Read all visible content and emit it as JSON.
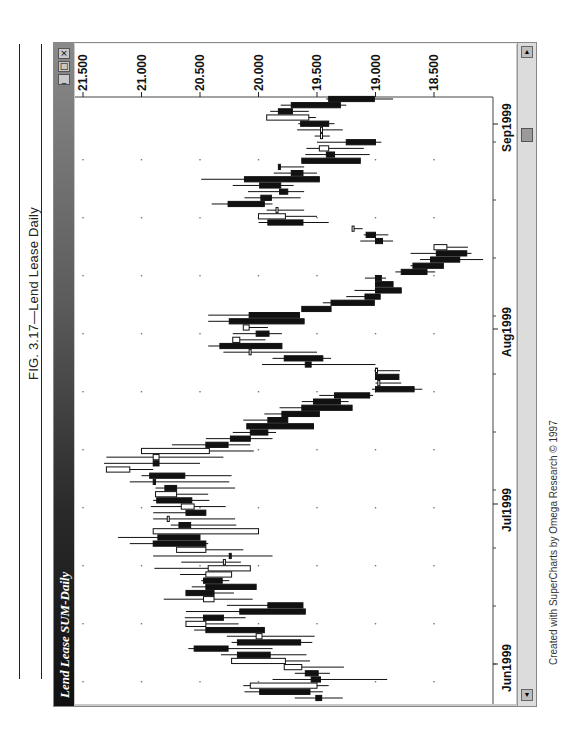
{
  "figure": {
    "caption": "FIG. 3.17—Lend Lease Daily",
    "credit": "Created with SuperCharts by Omega Research © 1997"
  },
  "window": {
    "title": "Lend Lease  SUM-Daily",
    "buttons": {
      "close": "×",
      "maximize": "□",
      "minimize": "_"
    },
    "scrollbar": {
      "up": "▲",
      "down": "▼"
    }
  },
  "chart_data": {
    "type": "candlestick",
    "title": "Lend Lease SUM-Daily",
    "orientation": "rotated 90° (time runs bottom→top, price increases leftward)",
    "price_axis": {
      "ticks": [
        21.5,
        21.0,
        20.5,
        20.0,
        19.5,
        19.0,
        18.5
      ],
      "tick_labels": [
        "21.500",
        "21.000",
        "20.500",
        "20.000",
        "19.500",
        "19.000",
        "18.500"
      ],
      "range": [
        18.0,
        21.6
      ]
    },
    "time_axis": {
      "month_labels": [
        "Jun1999",
        "Jul1999",
        "Aug1999",
        "Sep1999"
      ]
    },
    "grid": "dotted",
    "bars": [
      {
        "o": 19.51,
        "h": 19.69,
        "l": 19.28,
        "c": 19.46
      },
      {
        "o": 19.99,
        "h": 20.12,
        "l": 19.45,
        "c": 19.56
      },
      {
        "o": 19.5,
        "h": 20.13,
        "l": 19.4,
        "c": 20.07
      },
      {
        "o": 19.55,
        "h": 19.88,
        "l": 18.9,
        "c": 19.47
      },
      {
        "o": 19.6,
        "h": 19.69,
        "l": 19.39,
        "c": 19.49
      },
      {
        "o": 19.63,
        "h": 19.78,
        "l": 19.27,
        "c": 19.78
      },
      {
        "o": 19.77,
        "h": 20.17,
        "l": 19.56,
        "c": 20.23
      },
      {
        "o": 20.18,
        "h": 20.32,
        "l": 19.59,
        "c": 19.9
      },
      {
        "o": 20.55,
        "h": 20.6,
        "l": 19.88,
        "c": 20.26
      },
      {
        "o": 20.18,
        "h": 20.23,
        "l": 19.54,
        "c": 19.64
      },
      {
        "o": 19.97,
        "h": 20.27,
        "l": 19.52,
        "c": 20.02
      },
      {
        "o": 20.45,
        "h": 20.55,
        "l": 20.02,
        "c": 19.95
      },
      {
        "o": 20.45,
        "h": 20.62,
        "l": 20.17,
        "c": 20.62
      },
      {
        "o": 20.47,
        "h": 20.63,
        "l": 20.11,
        "c": 20.3
      },
      {
        "o": 20.16,
        "h": 20.62,
        "l": 19.83,
        "c": 19.6
      },
      {
        "o": 19.92,
        "h": 20.27,
        "l": 19.65,
        "c": 19.62
      },
      {
        "o": 20.38,
        "h": 20.81,
        "l": 20.05,
        "c": 20.47
      },
      {
        "o": 20.62,
        "h": 20.48,
        "l": 20.21,
        "c": 20.38
      },
      {
        "o": 20.45,
        "h": 20.57,
        "l": 20.02,
        "c": 20.02
      },
      {
        "o": 20.47,
        "h": 20.49,
        "l": 20.25,
        "c": 20.31
      },
      {
        "o": 20.23,
        "h": 20.67,
        "l": 20.23,
        "c": 20.45
      },
      {
        "o": 20.07,
        "h": 20.89,
        "l": 20.07,
        "c": 20.43
      },
      {
        "o": 20.3,
        "h": 20.66,
        "l": 20.15,
        "c": 20.3
      },
      {
        "o": 20.25,
        "h": 20.9,
        "l": 19.88,
        "c": 20.24
      },
      {
        "o": 20.45,
        "h": 20.45,
        "l": 20.13,
        "c": 20.7
      },
      {
        "o": 20.9,
        "h": 21.1,
        "l": 20.43,
        "c": 20.45
      },
      {
        "o": 20.86,
        "h": 21.2,
        "l": 20.56,
        "c": 20.5
      },
      {
        "o": 20.0,
        "h": 20.56,
        "l": 20.04,
        "c": 20.9
      },
      {
        "o": 20.68,
        "h": 20.75,
        "l": 20.19,
        "c": 20.58
      },
      {
        "o": 20.78,
        "h": 20.9,
        "l": 20.2,
        "c": 20.78
      },
      {
        "o": 20.62,
        "h": 20.9,
        "l": 20.52,
        "c": 20.45
      },
      {
        "o": 20.55,
        "h": 20.92,
        "l": 20.28,
        "c": 20.66
      },
      {
        "o": 20.87,
        "h": 20.9,
        "l": 20.42,
        "c": 20.57
      },
      {
        "o": 20.7,
        "h": 20.88,
        "l": 20.43,
        "c": 20.88
      },
      {
        "o": 20.8,
        "h": 20.88,
        "l": 20.2,
        "c": 20.7
      },
      {
        "o": 20.9,
        "h": 21.1,
        "l": 20.25,
        "c": 20.88
      },
      {
        "o": 20.93,
        "h": 21.0,
        "l": 20.23,
        "c": 20.63
      },
      {
        "o": 21.1,
        "h": 21.22,
        "l": 20.9,
        "c": 21.3
      },
      {
        "o": 20.9,
        "h": 21.32,
        "l": 20.5,
        "c": 20.85
      },
      {
        "o": 20.85,
        "h": 21.3,
        "l": 20.3,
        "c": 20.9
      },
      {
        "o": 20.42,
        "h": 20.25,
        "l": 20.04,
        "c": 21.0
      },
      {
        "o": 20.45,
        "h": 20.74,
        "l": 20.07,
        "c": 20.26
      },
      {
        "o": 20.24,
        "h": 20.45,
        "l": 19.88,
        "c": 20.07
      },
      {
        "o": 20.07,
        "h": 20.22,
        "l": 19.85,
        "c": 19.92
      },
      {
        "o": 20.1,
        "h": 20.06,
        "l": 19.75,
        "c": 19.53
      },
      {
        "o": 19.92,
        "h": 20.13,
        "l": 19.92,
        "c": 19.75
      },
      {
        "o": 19.8,
        "h": 19.95,
        "l": 19.55,
        "c": 19.48
      },
      {
        "o": 19.63,
        "h": 19.82,
        "l": 19.3,
        "c": 19.2
      },
      {
        "o": 19.53,
        "h": 19.63,
        "l": 19.23,
        "c": 19.3
      },
      {
        "o": 19.35,
        "h": 19.48,
        "l": 19.02,
        "c": 19.05
      },
      {
        "o": 19.0,
        "h": 19.03,
        "l": 18.6,
        "c": 18.67
      },
      {
        "o": 18.98,
        "h": 19.0,
        "l": 18.78,
        "c": 18.98
      },
      {
        "o": 19.0,
        "h": 19.0,
        "l": 18.8,
        "c": 18.8
      },
      {
        "o": 19.0,
        "h": 19.01,
        "l": 18.79,
        "c": 19.0
      },
      {
        "o": 19.6,
        "h": 19.97,
        "l": 19.0,
        "c": 19.55
      },
      {
        "o": 19.78,
        "h": 19.88,
        "l": 19.38,
        "c": 19.45
      },
      {
        "o": 20.08,
        "h": 20.3,
        "l": 19.5,
        "c": 20.08
      },
      {
        "o": 20.33,
        "h": 20.43,
        "l": 20.0,
        "c": 19.8
      },
      {
        "o": 20.16,
        "h": 20.12,
        "l": 19.94,
        "c": 20.22
      },
      {
        "o": 20.02,
        "h": 20.22,
        "l": 19.8,
        "c": 19.91
      },
      {
        "o": 20.08,
        "h": 20.08,
        "l": 19.92,
        "c": 20.13
      },
      {
        "o": 20.25,
        "h": 20.43,
        "l": 19.75,
        "c": 19.61
      },
      {
        "o": 20.08,
        "h": 20.43,
        "l": 19.83,
        "c": 19.65
      },
      {
        "o": 19.63,
        "h": 19.62,
        "l": 19.48,
        "c": 19.38
      },
      {
        "o": 19.38,
        "h": 19.45,
        "l": 19.01,
        "c": 19.01
      },
      {
        "o": 19.09,
        "h": 19.25,
        "l": 19.02,
        "c": 18.96
      },
      {
        "o": 19.0,
        "h": 19.18,
        "l": 18.83,
        "c": 18.78
      },
      {
        "o": 19.0,
        "h": 19.0,
        "l": 18.95,
        "c": 18.85
      },
      {
        "o": 19.0,
        "h": 19.09,
        "l": 18.91,
        "c": 18.95
      },
      {
        "o": 18.78,
        "h": 18.83,
        "l": 18.49,
        "c": 18.56
      },
      {
        "o": 18.68,
        "h": 18.7,
        "l": 18.49,
        "c": 18.42
      },
      {
        "o": 18.53,
        "h": 18.62,
        "l": 18.08,
        "c": 18.28
      },
      {
        "o": 18.48,
        "h": 18.7,
        "l": 18.18,
        "c": 18.22
      },
      {
        "o": 18.39,
        "h": 18.43,
        "l": 18.21,
        "c": 18.5
      },
      {
        "o": 19.0,
        "h": 19.13,
        "l": 18.85,
        "c": 18.94
      },
      {
        "o": 19.08,
        "h": 19.1,
        "l": 18.89,
        "c": 19.0
      },
      {
        "o": 19.2,
        "h": 19.2,
        "l": 19.11,
        "c": 19.2
      },
      {
        "o": 19.92,
        "h": 20.0,
        "l": 19.4,
        "c": 19.62
      },
      {
        "o": 19.77,
        "h": 19.95,
        "l": 19.5,
        "c": 20.0
      },
      {
        "o": 19.85,
        "h": 19.93,
        "l": 19.61,
        "c": 19.85
      },
      {
        "o": 20.26,
        "h": 20.4,
        "l": 19.88,
        "c": 19.95
      },
      {
        "o": 19.98,
        "h": 20.12,
        "l": 19.64,
        "c": 19.89
      },
      {
        "o": 19.82,
        "h": 20.09,
        "l": 19.61,
        "c": 19.75
      },
      {
        "o": 19.99,
        "h": 20.22,
        "l": 19.7,
        "c": 19.81
      },
      {
        "o": 20.12,
        "h": 20.49,
        "l": 19.64,
        "c": 19.48
      },
      {
        "o": 19.72,
        "h": 19.87,
        "l": 19.5,
        "c": 19.62
      },
      {
        "o": 19.83,
        "h": 19.72,
        "l": 19.61,
        "c": 19.82
      },
      {
        "o": 19.63,
        "h": 19.6,
        "l": 19.13,
        "c": 19.13
      },
      {
        "o": 19.42,
        "h": 19.6,
        "l": 19.05,
        "c": 19.35
      },
      {
        "o": 19.4,
        "h": 19.59,
        "l": 19.1,
        "c": 19.48
      },
      {
        "o": 19.25,
        "h": 19.5,
        "l": 18.95,
        "c": 19.0
      },
      {
        "o": 19.47,
        "h": 19.52,
        "l": 19.39,
        "c": 19.47
      },
      {
        "o": 19.47,
        "h": 19.67,
        "l": 19.28,
        "c": 19.47
      },
      {
        "o": 19.64,
        "h": 19.66,
        "l": 19.35,
        "c": 19.4
      },
      {
        "o": 19.57,
        "h": 19.92,
        "l": 19.51,
        "c": 19.93
      },
      {
        "o": 19.83,
        "h": 19.9,
        "l": 19.57,
        "c": 19.71
      },
      {
        "o": 19.72,
        "h": 19.81,
        "l": 19.25,
        "c": 19.3
      },
      {
        "o": 19.4,
        "h": 19.42,
        "l": 18.85,
        "c": 19.01
      }
    ]
  }
}
